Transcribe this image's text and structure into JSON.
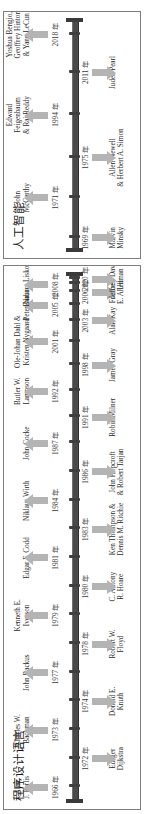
{
  "figure": {
    "kind": "timeline-diagram",
    "orientation": "rotated-90-ccw",
    "axis_color": "#4a4a4a",
    "arrow_color": "#b4b4b4",
    "border_color": "#7d7d7d"
  },
  "panels": [
    {
      "id": "programming-languages",
      "title": "程序设计语言",
      "axis_start_label": "",
      "axis_end_label": "",
      "events": [
        {
          "year": "1966 年",
          "name": "Alan\nJ. Perlis",
          "side": "above",
          "pos": 3.0
        },
        {
          "year": "1972 年",
          "name": "Edsger\nDijkstra",
          "side": "below",
          "pos": 8.5
        },
        {
          "year": "1973 年",
          "name": "Charles W.\nBachman",
          "side": "above",
          "pos": 14.0
        },
        {
          "year": "1974 年",
          "name": "Donald E.\nKnuth",
          "side": "below",
          "pos": 19.5
        },
        {
          "year": "1977 年",
          "name": "John Backus",
          "side": "above",
          "pos": 25.0
        },
        {
          "year": "1978 年",
          "name": "Robert W.\nFloyd",
          "side": "below",
          "pos": 30.5
        },
        {
          "year": "1979 年",
          "name": "Kenneth E.\nIverson",
          "side": "above",
          "pos": 36.0
        },
        {
          "year": "1980 年",
          "name": "C. Antony\nR. Hoare",
          "side": "below",
          "pos": 41.5
        },
        {
          "year": "1981 年",
          "name": "Edgar F. Codd",
          "side": "above",
          "pos": 47.0
        },
        {
          "year": "1983 年",
          "name": "Ken Thompson &\nDennis M. Ritchie",
          "side": "below",
          "pos": 52.5
        },
        {
          "year": "1984 年",
          "name": "Niklaus Wirth",
          "side": "above",
          "pos": 58.0
        },
        {
          "year": "1986 年",
          "name": "John Hopcroft\n& Robert Tarjan",
          "side": "below",
          "pos": 63.5
        },
        {
          "year": "1987 年",
          "name": "John Cocke",
          "side": "above",
          "pos": 69.0
        },
        {
          "year": "1991 年",
          "name": "Robin Milner",
          "side": "below",
          "pos": 74.0
        },
        {
          "year": "1992 年",
          "name": "Butler W.\nLampson",
          "side": "above",
          "pos": 79.0
        },
        {
          "year": "1998 年",
          "name": "James Gray",
          "side": "below",
          "pos": 84.0
        },
        {
          "year": "2001 年",
          "name": "Ole-Johan Dahl &\nKristen Nygaard",
          "side": "above",
          "pos": 88.5
        },
        {
          "year": "2003 年",
          "name": "Alan Kay",
          "side": "below",
          "pos": 92.5
        },
        {
          "year": "2005 年",
          "name": "Peter Naur",
          "side": "above",
          "pos": 95.5
        },
        {
          "year": "2006 年",
          "name": "Frances\nE. Allen",
          "side": "below",
          "pos": 98.0
        },
        {
          "year": "2008 年",
          "name": "Barbara Liskov",
          "side": "above",
          "pos": 99.5
        },
        {
          "year": "2020 年",
          "name": "Jeffrey David\nUllman",
          "side": "below",
          "pos": 100.5
        }
      ]
    },
    {
      "id": "artificial-intelligence",
      "title": "人工智能",
      "axis_start_label": "",
      "axis_end_label": "",
      "events": [
        {
          "year": "1969 年",
          "name": "Marvin\nMinsky",
          "side": "below",
          "pos": 6.0
        },
        {
          "year": "1971 年",
          "name": "John\nMcCarthy",
          "side": "above",
          "pos": 23.0
        },
        {
          "year": "1975 年",
          "name": "Allen Newell\n& Herbert A. Simon",
          "side": "below",
          "pos": 40.0
        },
        {
          "year": "1994 年",
          "name": "Edward\nFeigenbaum\n& Raj Reddy",
          "side": "above",
          "pos": 58.0
        },
        {
          "year": "2011 年",
          "name": "Judea Pearl",
          "side": "below",
          "pos": 76.0
        },
        {
          "year": "2018 年",
          "name": "Yoshua Bengio,\nGeoffrey Hinton\n& Yann LeCun",
          "side": "above",
          "pos": 92.0
        }
      ]
    }
  ]
}
